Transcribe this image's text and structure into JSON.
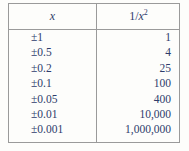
{
  "table": {
    "headers": {
      "left": "x",
      "right_numerator": "1",
      "right_slash": "/",
      "right_base": "x",
      "right_exponent": "2"
    },
    "rows": [
      {
        "x": "±1",
        "y": "1"
      },
      {
        "x": "±0.5",
        "y": "4"
      },
      {
        "x": "±0.2",
        "y": "25"
      },
      {
        "x": "±0.1",
        "y": "100"
      },
      {
        "x": "±0.05",
        "y": "400"
      },
      {
        "x": "±0.01",
        "y": "10,000"
      },
      {
        "x": "±0.001",
        "y": "1,000,000"
      }
    ]
  },
  "chart_data": {
    "type": "table",
    "title": "",
    "columns": [
      "x",
      "1/x^2"
    ],
    "x": [
      "±1",
      "±0.5",
      "±0.2",
      "±0.1",
      "±0.05",
      "±0.01",
      "±0.001"
    ],
    "values": [
      1,
      4,
      25,
      100,
      400,
      10000,
      1000000
    ],
    "xlabel": "x",
    "ylabel": "1/x^2",
    "grid": false,
    "legend": "none"
  },
  "colors": {
    "text": "#2e3c6b",
    "rule": "#9a9a9a",
    "background": "#fdfdfb"
  }
}
